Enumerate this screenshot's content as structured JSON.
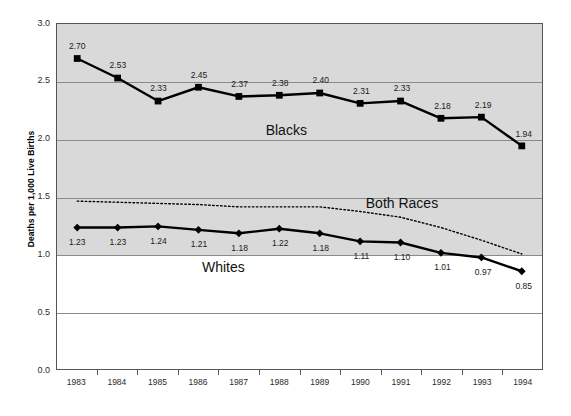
{
  "chart_data": {
    "type": "line",
    "title": "",
    "xlabel": "",
    "ylabel": "Deaths per 1,000 Live Births",
    "ylim": [
      0.0,
      3.0
    ],
    "ytick_labels": [
      "0.0",
      "0.5",
      "1.0",
      "1.5",
      "2.0",
      "2.5",
      "3.0"
    ],
    "ytick_values": [
      0.0,
      0.5,
      1.0,
      1.5,
      2.0,
      2.5,
      3.0
    ],
    "grid": true,
    "legend_position": "inline-annotations",
    "categories": [
      "1983",
      "1984",
      "1985",
      "1986",
      "1987",
      "1988",
      "1989",
      "1990",
      "1991",
      "1992",
      "1993",
      "1994"
    ],
    "x": [
      1983,
      1984,
      1985,
      1986,
      1987,
      1988,
      1989,
      1990,
      1991,
      1992,
      1993,
      1994
    ],
    "series": [
      {
        "name": "Blacks",
        "marker": "square",
        "linestyle": "solid",
        "color": "#000000",
        "values": [
          2.7,
          2.53,
          2.33,
          2.45,
          2.37,
          2.38,
          2.4,
          2.31,
          2.33,
          2.18,
          2.19,
          1.94
        ],
        "labels": [
          "2.70",
          "2.53",
          "2.33",
          "2.45",
          "2.37",
          "2.38",
          "2.40",
          "2.31",
          "2.33",
          "2.18",
          "2.19",
          "1.94"
        ],
        "label_position": "above",
        "annotation": "Blacks",
        "annotation_x": 1988.15,
        "annotation_y": 2.08
      },
      {
        "name": "Both Races",
        "marker": "none",
        "linestyle": "dotted",
        "color": "#000000",
        "values": [
          1.46,
          1.45,
          1.44,
          1.43,
          1.41,
          1.41,
          1.41,
          1.37,
          1.32,
          1.23,
          1.12,
          1.0
        ],
        "labels": [],
        "label_position": "none",
        "annotation": "Both Races",
        "annotation_x": 1991.0,
        "annotation_y": 1.45
      },
      {
        "name": "Whites",
        "marker": "diamond",
        "linestyle": "solid",
        "color": "#000000",
        "values": [
          1.23,
          1.23,
          1.24,
          1.21,
          1.18,
          1.22,
          1.18,
          1.11,
          1.1,
          1.01,
          0.97,
          0.85
        ],
        "labels": [
          "1.23",
          "1.23",
          "1.24",
          "1.21",
          "1.18",
          "1.22",
          "1.18",
          "1.11",
          "1.10",
          "1.01",
          "0.97",
          "0.85"
        ],
        "label_position": "below",
        "annotation": "Whites",
        "annotation_x": 1986.6,
        "annotation_y": 0.9
      }
    ],
    "colors": {
      "plot_background_upper": "#d9d9d9",
      "plot_background_lower": "#ffffff",
      "gridline": "#8a8a8a",
      "axis": "#555555",
      "series": "#000000"
    },
    "shading": {
      "note": "plot background shaded gray above 1.0",
      "shade_above": 1.0
    }
  }
}
